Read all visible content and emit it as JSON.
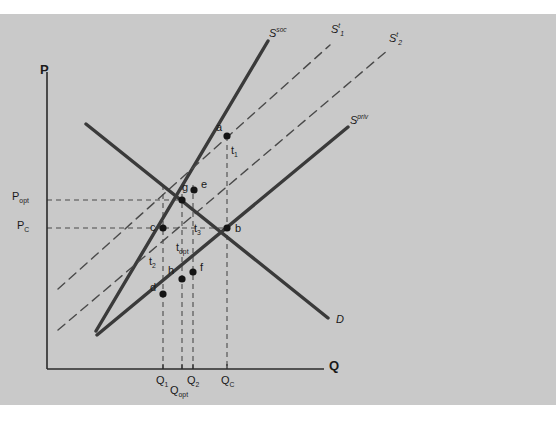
{
  "figure": {
    "type": "supply-demand externality / optimal tax diagram",
    "background_color": "#c9c9c9",
    "page_color": "#ffffff",
    "line_color": "#3a3a3a",
    "dash_color": "#4a4a4a",
    "axes": {
      "y_label": "P",
      "x_label": "Q",
      "origin": {
        "x": 47,
        "y": 369
      }
    }
  },
  "curves": [
    {
      "id": "s_soc",
      "label_text": "S",
      "label_sup": "soc",
      "style": "solid",
      "name": "social-supply-curve",
      "x1": 96,
      "y1": 331,
      "x2": 268,
      "y2": 41
    },
    {
      "id": "s_t1",
      "label_text": "S",
      "label_sup": "t",
      "label_sub": "1",
      "style": "dashed",
      "name": "supply-with-tax-1-curve",
      "x1": 58,
      "y1": 289,
      "x2": 330,
      "y2": 45
    },
    {
      "id": "s_t2",
      "label_text": "S",
      "label_sup": "t",
      "label_sub": "2",
      "style": "dashed",
      "name": "supply-with-tax-2-curve",
      "x1": 58,
      "y1": 330,
      "x2": 388,
      "y2": 50
    },
    {
      "id": "s_priv",
      "label_text": "S",
      "label_sup": "priv",
      "style": "solid",
      "name": "private-supply-curve",
      "x1": 97,
      "y1": 335,
      "x2": 348,
      "y2": 127
    },
    {
      "id": "d",
      "label_text": "D",
      "style": "solid",
      "name": "demand-curve",
      "x1": 86,
      "y1": 124,
      "x2": 328,
      "y2": 318
    }
  ],
  "curve_labels": [
    {
      "id": "s_soc_label",
      "text": "S",
      "sup": "soc",
      "x": 269,
      "y": 26,
      "name": "s-soc-label"
    },
    {
      "id": "s_t1_label",
      "text": "S",
      "sup": "t",
      "sub": "1",
      "x": 331,
      "y": 22,
      "name": "s-t1-label"
    },
    {
      "id": "s_t2_label",
      "text": "S",
      "sup": "t",
      "sub": "2",
      "x": 389,
      "y": 31,
      "name": "s-t2-label"
    },
    {
      "id": "s_priv_label",
      "text": "S",
      "sup": "priv",
      "x": 350,
      "y": 113,
      "name": "s-priv-label"
    },
    {
      "id": "d_label",
      "text": "D",
      "x": 336,
      "y": 313,
      "name": "d-label"
    }
  ],
  "points": [
    {
      "id": "a",
      "label": "a",
      "px": 227,
      "py": 136,
      "lx": 216,
      "ly": 121,
      "name": "point-a"
    },
    {
      "id": "g",
      "label": "g",
      "px": 182,
      "py": 200,
      "lx": 182,
      "ly": 181,
      "name": "point-g"
    },
    {
      "id": "e",
      "label": "e",
      "px": 194,
      "py": 190,
      "lx": 201,
      "ly": 178,
      "name": "point-e"
    },
    {
      "id": "c",
      "label": "c",
      "px": 163,
      "py": 228,
      "lx": 150,
      "ly": 221,
      "name": "point-c"
    },
    {
      "id": "b",
      "label": "b",
      "px": 227,
      "py": 228,
      "lx": 235,
      "ly": 222,
      "name": "point-b"
    },
    {
      "id": "f",
      "label": "f",
      "px": 193,
      "py": 272,
      "lx": 200,
      "ly": 261,
      "name": "point-f"
    },
    {
      "id": "h",
      "label": "h",
      "px": 182,
      "py": 279,
      "lx": 168,
      "ly": 264,
      "name": "point-h"
    },
    {
      "id": "d",
      "label": "d",
      "px": 163,
      "py": 294,
      "lx": 150,
      "ly": 281,
      "name": "point-d"
    }
  ],
  "segment_labels": [
    {
      "id": "t1",
      "text": "t",
      "sub": "1",
      "x": 231,
      "y": 144,
      "name": "tax-t1-label"
    },
    {
      "id": "t3",
      "text": "t",
      "sub": "3",
      "x": 194,
      "y": 222,
      "name": "tax-t3-label"
    },
    {
      "id": "topt",
      "text": "t",
      "sub": "opt",
      "x": 176,
      "y": 241,
      "name": "tax-topt-label"
    },
    {
      "id": "t2",
      "text": "t",
      "sub": "2",
      "x": 149,
      "y": 255,
      "name": "tax-t2-label"
    }
  ],
  "price_axis_labels": [
    {
      "id": "p_opt",
      "text": "P",
      "sub": "opt",
      "x": 12,
      "y": 190,
      "gy": 200,
      "name": "price-opt-label"
    },
    {
      "id": "p_c",
      "text": "P",
      "sub": "C",
      "x": 17,
      "y": 219,
      "gy": 228,
      "name": "price-c-label"
    }
  ],
  "quantity_axis_labels": [
    {
      "id": "q1",
      "text": "Q",
      "sub": "1",
      "x": 156,
      "y": 374,
      "gx": 163,
      "name": "quantity-q1-label"
    },
    {
      "id": "q_opt",
      "text": "Q",
      "sub": "opt",
      "x": 170,
      "y": 384,
      "gx": 182,
      "name": "quantity-qopt-label"
    },
    {
      "id": "q2",
      "text": "Q",
      "sub": "2",
      "x": 187,
      "y": 374,
      "gx": 193,
      "name": "quantity-q2-label"
    },
    {
      "id": "q_c",
      "text": "Q",
      "sub": "C",
      "x": 221,
      "y": 374,
      "gx": 227,
      "name": "quantity-qc-label"
    }
  ],
  "axis_titles": {
    "y": {
      "text": "P",
      "x": 40,
      "y": 62,
      "name": "y-axis-title"
    },
    "x": {
      "text": "Q",
      "x": 329,
      "y": 358,
      "name": "x-axis-title"
    }
  },
  "guide_lines": [
    {
      "id": "h_popt",
      "orientation": "horizontal",
      "x1": 47,
      "x2": 182,
      "y": 200,
      "name": "guide-popt-horizontal"
    },
    {
      "id": "h_pc",
      "orientation": "horizontal",
      "x1": 47,
      "x2": 227,
      "y": 228,
      "name": "guide-pc-horizontal"
    },
    {
      "id": "v_q1",
      "orientation": "vertical",
      "x": 163,
      "y1": 185,
      "y2": 369,
      "name": "guide-q1-vertical"
    },
    {
      "id": "v_qopt",
      "orientation": "vertical",
      "x": 182,
      "y1": 185,
      "y2": 369,
      "name": "guide-qopt-vertical"
    },
    {
      "id": "v_q2",
      "orientation": "vertical",
      "x": 193,
      "y1": 185,
      "y2": 369,
      "name": "guide-q2-vertical"
    },
    {
      "id": "v_qc",
      "orientation": "vertical",
      "x": 227,
      "y1": 136,
      "y2": 369,
      "name": "guide-qc-vertical"
    }
  ]
}
